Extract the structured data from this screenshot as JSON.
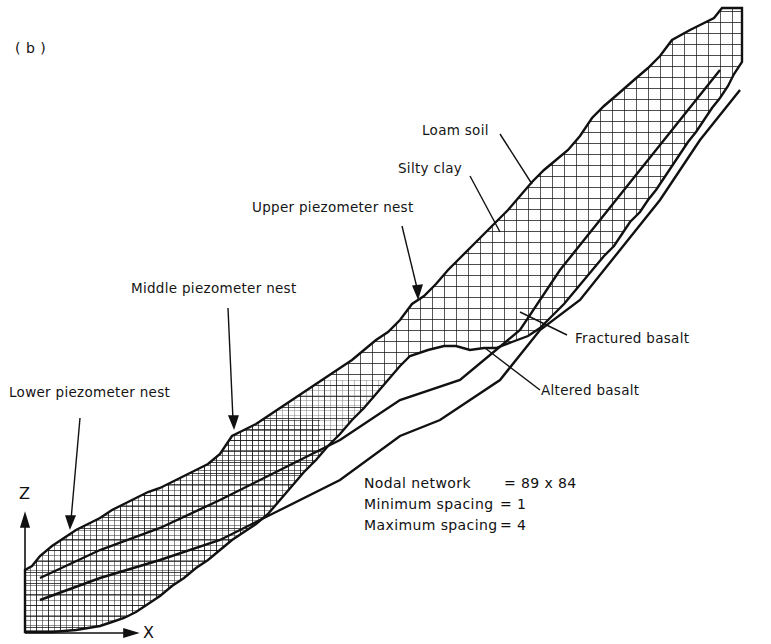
{
  "figure": {
    "panel_label": "( b )",
    "axes": {
      "vertical": "Z",
      "horizontal": "X"
    },
    "labels": [
      {
        "id": "loam-soil",
        "text": "Loam soil"
      },
      {
        "id": "silty-clay",
        "text": "Silty clay"
      },
      {
        "id": "upper-piezometer-nest",
        "text": "Upper piezometer nest"
      },
      {
        "id": "middle-piezometer-nest",
        "text": "Middle piezometer nest"
      },
      {
        "id": "lower-piezometer-nest",
        "text": "Lower piezometer nest"
      },
      {
        "id": "fractured-basalt",
        "text": "Fractured basalt"
      },
      {
        "id": "altered-basalt",
        "text": "Altered basalt"
      }
    ],
    "network_info": {
      "rows": [
        {
          "key": "Nodal network",
          "value": "= 89 x 84"
        },
        {
          "key": "Minimum spacing",
          "value": "= 1"
        },
        {
          "key": "Maximum spacing",
          "value": "= 4"
        }
      ]
    },
    "colors": {
      "line": "#111111",
      "background": "#ffffff"
    }
  }
}
